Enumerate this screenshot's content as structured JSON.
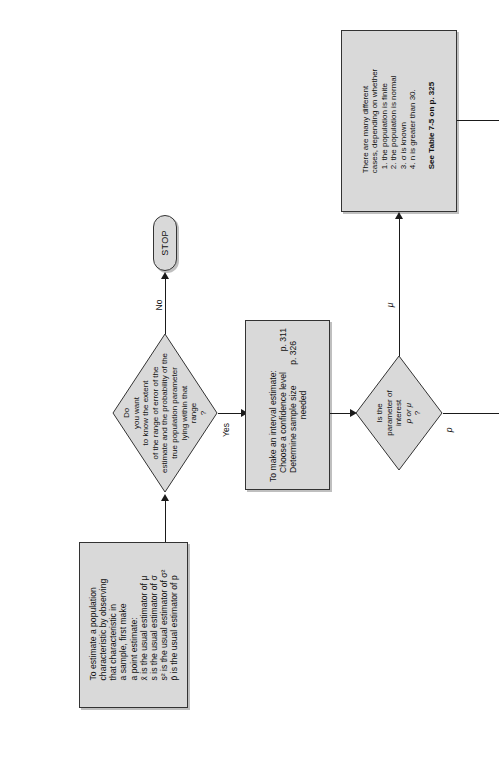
{
  "diagram": {
    "orientation": "rotated-90-ccw",
    "colors": {
      "shape_fill": "#d9d9d9",
      "shape_stroke": "#333333",
      "line": "#1a1a1a",
      "page_background": "#ffffff"
    }
  },
  "nodes": {
    "start": {
      "type": "terminator",
      "label": "START"
    },
    "point_estimate": {
      "type": "process",
      "lines": [
        "To estimate a population",
        "characteristic by observing",
        "that characteristic in",
        "a sample, first make",
        "a point estimate:",
        "x̄ is the usual estimator of μ",
        "s is the usual estimator of σ",
        "s² is the usual estimator of σ²",
        "p̄ is the usual estimator of p"
      ]
    },
    "decision_range": {
      "type": "decision",
      "lines": [
        "Do",
        "you want",
        "to know the extent",
        "of the range of error of the",
        "estimate and the probability of the",
        "true population parameter",
        "lying within that",
        "range",
        "?"
      ]
    },
    "stop": {
      "type": "terminator",
      "label": "STOP"
    },
    "interval_estimate": {
      "type": "process",
      "lines": [
        "To make an interval estimate:",
        "Choose a confidence level",
        "Determine sample size",
        "needed"
      ],
      "page_refs": [
        "p. 311",
        "p. 326"
      ]
    },
    "decision_parameter": {
      "type": "decision",
      "lines": [
        "Is the",
        "parameter of",
        "interest",
        "p or μ",
        "?"
      ]
    },
    "cases": {
      "type": "process",
      "lines": [
        "There are many different",
        "cases, depending on whether",
        "1. the population is finite",
        "2. the population is normal",
        "3. σ is known",
        "4. n is greater than 30."
      ],
      "footer": "See Table 7-5 on p. 325"
    }
  },
  "edges": {
    "no_label": "No",
    "yes_label": "Yes",
    "mu_label": "μ",
    "p_label": "p"
  }
}
